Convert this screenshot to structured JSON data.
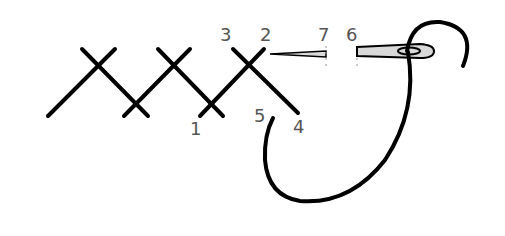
{
  "diagram": {
    "labels": [
      {
        "id": "1",
        "text": "1",
        "x": 190,
        "y": 120
      },
      {
        "id": "2",
        "text": "2",
        "x": 260,
        "y": 26
      },
      {
        "id": "3",
        "text": "3",
        "x": 220,
        "y": 26
      },
      {
        "id": "4",
        "text": "4",
        "x": 293,
        "y": 118
      },
      {
        "id": "5",
        "text": "5",
        "x": 254,
        "y": 107
      },
      {
        "id": "6",
        "text": "6",
        "x": 346,
        "y": 26
      },
      {
        "id": "7",
        "text": "7",
        "x": 318,
        "y": 26
      }
    ],
    "colors": {
      "stitch": "#000000",
      "label": "#555555",
      "needle_fill": "#d9d9d9",
      "background": "#ffffff"
    }
  }
}
